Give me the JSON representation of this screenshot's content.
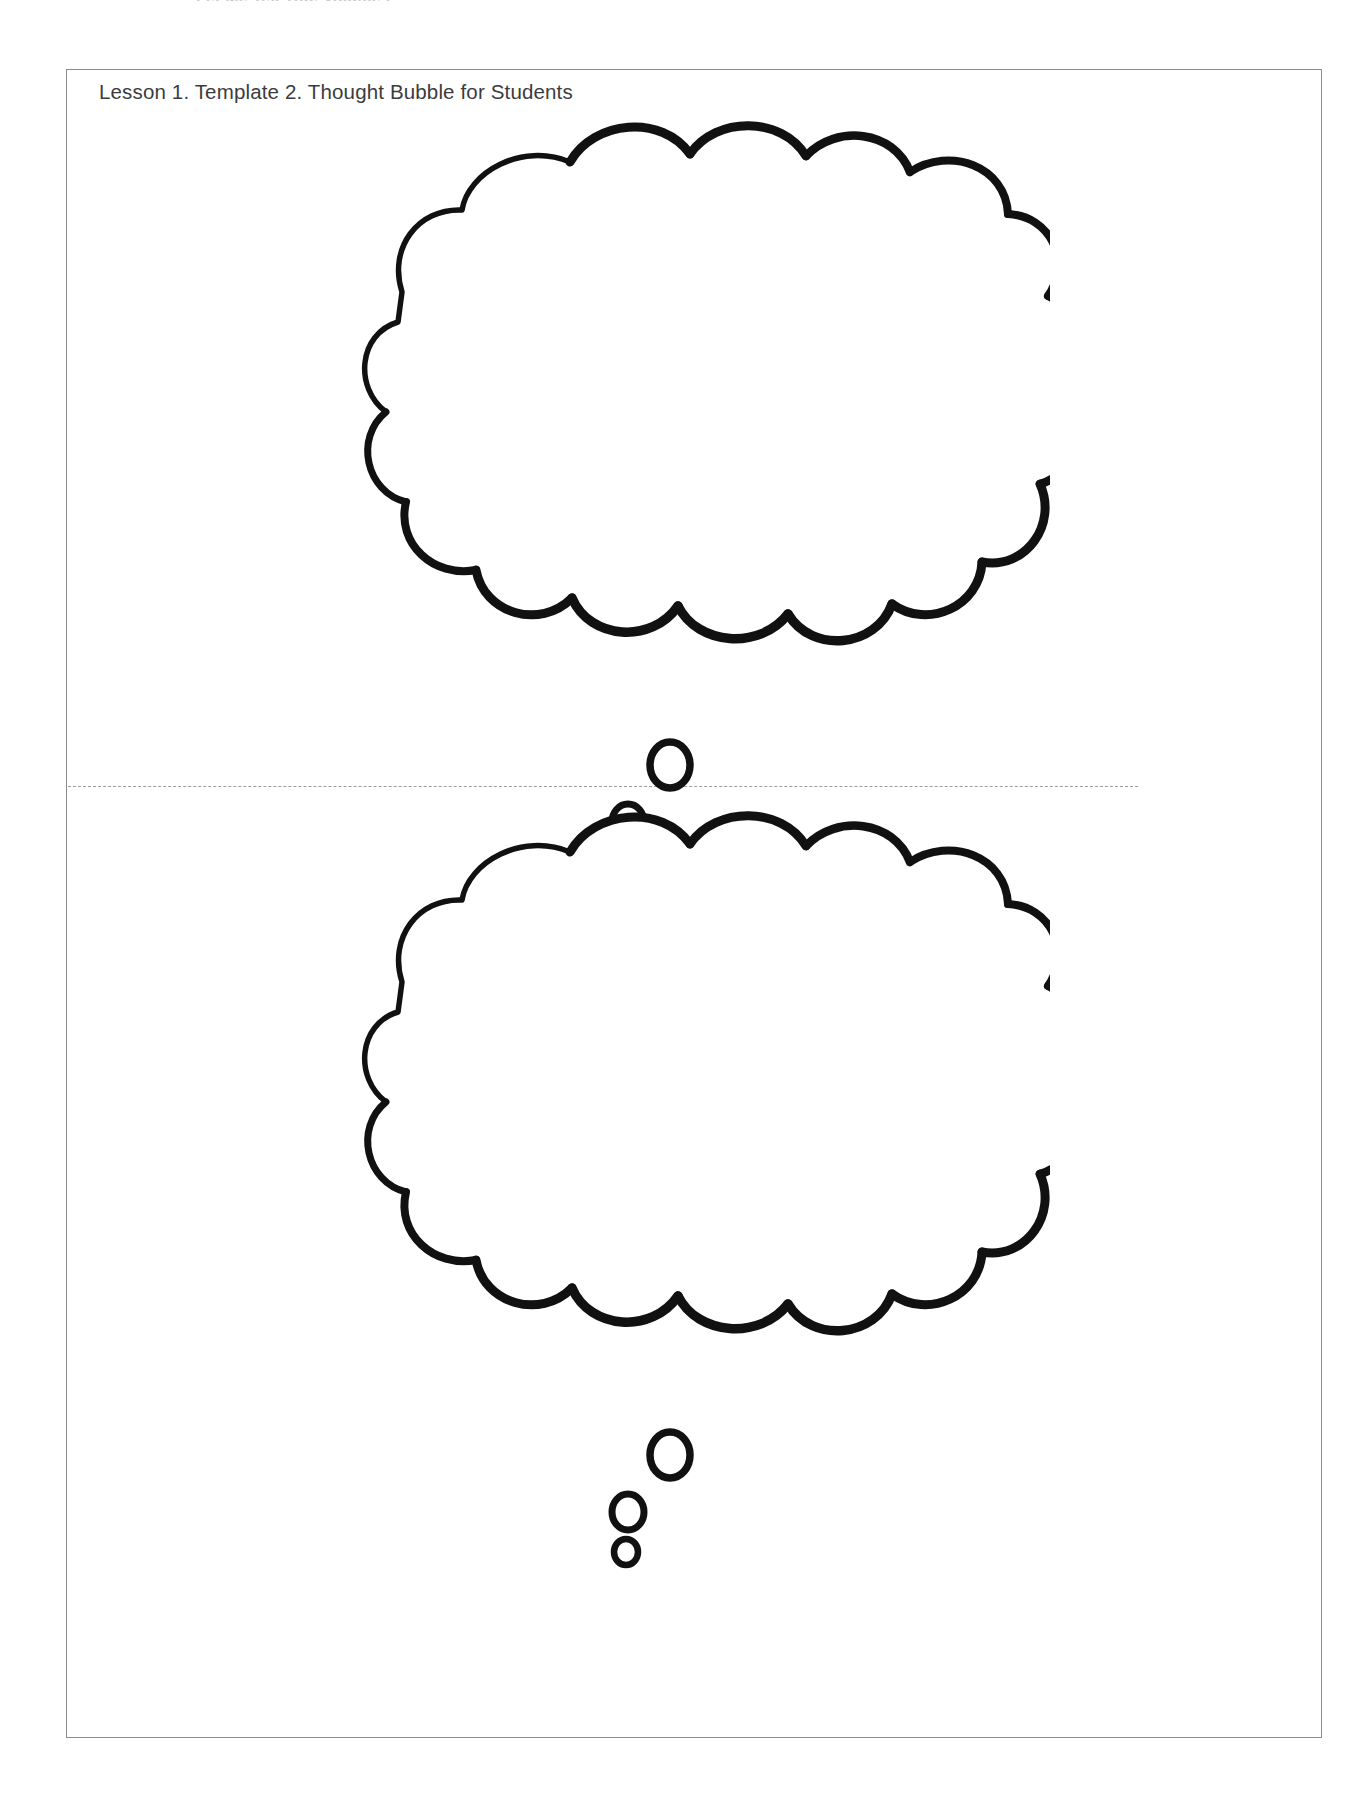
{
  "document": {
    "running_head": "Let Me Tell You, Volume 2",
    "page_background": "#ffffff",
    "frame_border_color": "#8a8d90",
    "ink_color": "#111111"
  },
  "sheet": {
    "title": "Lesson 1. Template 2. Thought Bubble for Students"
  },
  "fold": {
    "style": "dashed",
    "color": "#9a9da0"
  },
  "bubbles": [
    {
      "id": "thought-bubble-top",
      "label": "Thought bubble outline (top half)",
      "fill": "#ffffff",
      "stroke": "#111111",
      "tail_circles": 3
    },
    {
      "id": "thought-bubble-bottom",
      "label": "Thought bubble outline (bottom half)",
      "fill": "#ffffff",
      "stroke": "#111111",
      "tail_circles": 3
    }
  ]
}
